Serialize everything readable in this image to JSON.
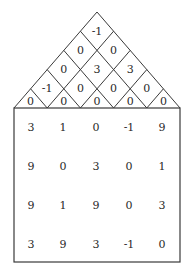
{
  "triangle": {
    "rows": [
      [
        "-1"
      ],
      [
        "0",
        "0"
      ],
      [
        "0",
        "3",
        "3"
      ],
      [
        "-1",
        "0",
        "0",
        "0"
      ],
      [
        "0",
        "0",
        "0",
        "0",
        "0"
      ]
    ]
  },
  "grid": {
    "rows": [
      [
        "3",
        "1",
        "0",
        "-1",
        "9"
      ],
      [
        "9",
        "0",
        "3",
        "0",
        "1"
      ],
      [
        "9",
        "1",
        "9",
        "0",
        "3"
      ],
      [
        "3",
        "9",
        "3",
        "-1",
        "0"
      ]
    ]
  },
  "colors": {
    "line": "#3a3a3a",
    "text": "#2a2a2a",
    "background": "#ffffff"
  }
}
